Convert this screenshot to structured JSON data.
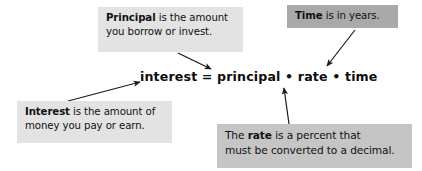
{
  "figure": {
    "title_text": "Simple interest formula annotated diagram",
    "background_color": "#ffffff"
  },
  "formula": {
    "text": "interest = principal • rate • time",
    "color": "#0d0d0d"
  },
  "callouts": {
    "principal": {
      "line1_bold": "Principal",
      "line1_rest": " is the amount",
      "line2": "you borrow or invest.",
      "background_color": "#e3e3e3"
    },
    "time": {
      "line1_bold": "Time",
      "line1_rest": " is in years.",
      "background_color": "#a9a9a9"
    },
    "interest": {
      "line1_bold": "Interest",
      "line1_rest": " is the amount of",
      "line2": "money you pay or earn.",
      "background_color": "#e3e3e3"
    },
    "rate": {
      "line1_pre": "The ",
      "line1_bold": "rate",
      "line1_rest": " is a percent that",
      "line2": "must be converted to a decimal.",
      "background_color": "#c5c5c5"
    }
  },
  "arrows": {
    "color": "#1a1a1a",
    "principal_to_formula": "from Principal box down-right to word principal",
    "time_to_formula": "from Time box down-left to word time",
    "interest_to_formula": "from Interest box up-right to word interest",
    "rate_to_formula": "from rate box up to word rate"
  }
}
